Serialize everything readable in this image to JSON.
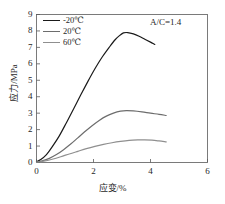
{
  "chart_data": {
    "type": "line",
    "title": "",
    "xlabel": "应变/%",
    "ylabel": "应力/MPa",
    "xlim": [
      0,
      6
    ],
    "ylim": [
      0,
      9
    ],
    "xticks": [
      0,
      2,
      4,
      6
    ],
    "xtick_labels": [
      "0",
      "2",
      "4",
      "6"
    ],
    "yticks": [
      0,
      1,
      2,
      3,
      4,
      5,
      6,
      7,
      8,
      9
    ],
    "ytick_labels": [
      "0",
      "1",
      "2",
      "3",
      "4",
      "5",
      "6",
      "7",
      "8",
      "9"
    ],
    "grid": false,
    "legend_position": "upper left",
    "annotations": [
      {
        "text": "A/C=1.4",
        "x": 4.3,
        "y": 8.4
      }
    ],
    "series": [
      {
        "name": "-20℃",
        "color": "#1a1a1a",
        "x": [
          0.0,
          0.15,
          0.35,
          0.55,
          0.8,
          1.05,
          1.3,
          1.55,
          1.8,
          2.05,
          2.3,
          2.55,
          2.75,
          2.9,
          3.05,
          3.2,
          3.4,
          3.6,
          3.8,
          4.0,
          4.15
        ],
        "y": [
          0.05,
          0.18,
          0.48,
          0.95,
          1.62,
          2.42,
          3.25,
          4.1,
          4.92,
          5.7,
          6.4,
          7.0,
          7.45,
          7.7,
          7.88,
          7.9,
          7.82,
          7.68,
          7.5,
          7.32,
          7.18
        ]
      },
      {
        "name": "20℃",
        "color": "#6d6d6d",
        "x": [
          0.0,
          0.2,
          0.45,
          0.7,
          0.95,
          1.2,
          1.45,
          1.7,
          1.95,
          2.2,
          2.45,
          2.7,
          2.95,
          3.15,
          3.4,
          3.7,
          4.0,
          4.3,
          4.55
        ],
        "y": [
          0.03,
          0.1,
          0.25,
          0.48,
          0.78,
          1.12,
          1.5,
          1.88,
          2.24,
          2.56,
          2.82,
          3.0,
          3.12,
          3.16,
          3.14,
          3.08,
          3.0,
          2.93,
          2.86
        ]
      },
      {
        "name": "60℃",
        "color": "#8f8f8f",
        "x": [
          0.0,
          0.25,
          0.55,
          0.85,
          1.15,
          1.45,
          1.75,
          2.05,
          2.35,
          2.65,
          2.95,
          3.25,
          3.55,
          3.8,
          4.05,
          4.3,
          4.55
        ],
        "y": [
          0.02,
          0.08,
          0.2,
          0.35,
          0.52,
          0.68,
          0.84,
          0.98,
          1.1,
          1.2,
          1.28,
          1.34,
          1.37,
          1.38,
          1.36,
          1.31,
          1.25
        ]
      }
    ]
  },
  "legend": {
    "items": [
      {
        "label": "-20℃"
      },
      {
        "label": "20℃"
      },
      {
        "label": "60℃"
      }
    ]
  },
  "annotation": {
    "text": "A/C=1.4"
  },
  "axes": {
    "x_title": "应变/%",
    "y_title": "应力/MPa"
  }
}
